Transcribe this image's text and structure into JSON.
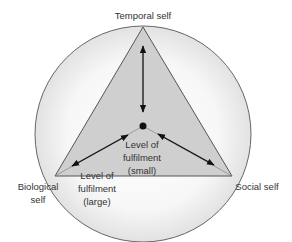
{
  "diagram": {
    "vertices": {
      "top": {
        "label": "Temporal self"
      },
      "left": {
        "label_line1": "Biological",
        "label_line2": "self"
      },
      "right": {
        "label": "Social self"
      }
    },
    "inner_label": {
      "line1": "Level of",
      "line2": "fulfilment",
      "line3": "(small)"
    },
    "outer_label": {
      "line1": "Level of",
      "line2": "fulfilment",
      "line3": "(large)"
    },
    "colors": {
      "triangle_fill": "#cfcfcf",
      "circle_fill": "#ececec",
      "stroke": "#555555",
      "arrow": "#111111"
    }
  }
}
